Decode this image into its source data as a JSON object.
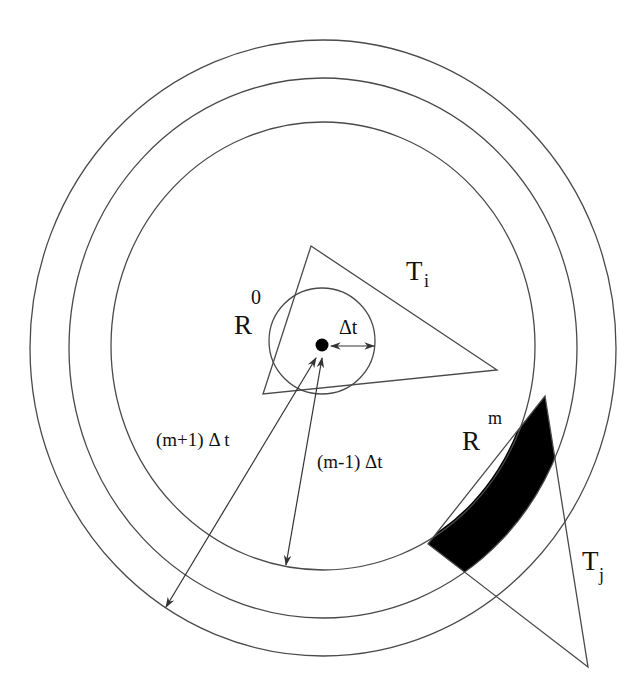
{
  "figure": {
    "labels": {
      "r0_main": "R",
      "r0_sup": "0",
      "ti_main": "T",
      "ti_sub": "i",
      "delta_t": "Δt",
      "m_plus_1": "(m+1)  Δ t",
      "m_minus_1": "(m-1)  Δt",
      "rm_main": "R",
      "rm_sup": "m",
      "tj_main": "T",
      "tj_sub": "j"
    },
    "colors": {
      "line": "#4a4a4a",
      "fill": "#000000",
      "background": "#ffffff"
    },
    "rings": [
      {
        "name": "inner",
        "cx": 323,
        "cy": 346,
        "rx": 212,
        "ry": 224
      },
      {
        "name": "middle",
        "cx": 323,
        "cy": 348,
        "rx": 254,
        "ry": 270
      },
      {
        "name": "outer",
        "cx": 323,
        "cy": 348,
        "rx": 293,
        "ry": 308
      }
    ],
    "small_circle": {
      "cx": 322,
      "cy": 341,
      "r": 53
    },
    "center_point": {
      "cx": 322,
      "cy": 345
    },
    "triangle_i": [
      [
        311,
        246
      ],
      [
        497,
        370
      ],
      [
        263,
        394
      ]
    ],
    "triangle_j": [
      [
        545,
        396
      ],
      [
        588,
        667
      ],
      [
        428,
        544
      ]
    ]
  }
}
